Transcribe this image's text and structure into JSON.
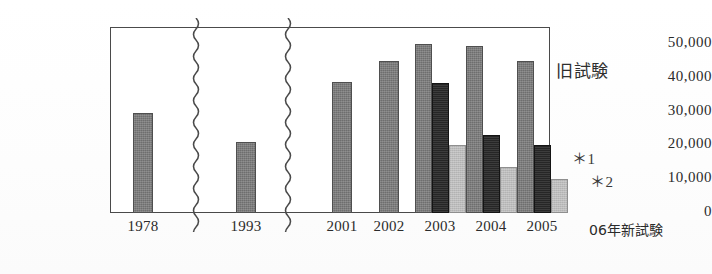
{
  "chart_data": {
    "type": "bar",
    "title": "",
    "xlabel": "",
    "ylabel": "",
    "ylim": [
      0,
      55000
    ],
    "grid": true,
    "legend_position": "inside-right",
    "categories": [
      "1978",
      "1993",
      "2001",
      "2002",
      "2003",
      "2004",
      "2005"
    ],
    "series": [
      {
        "name": "series-1",
        "color": "#6e6e6e",
        "values": [
          29500,
          21000,
          38700,
          45000,
          50000,
          49500,
          45000
        ]
      },
      {
        "name": "series-2",
        "color": "#262626",
        "values": [
          null,
          null,
          null,
          null,
          38500,
          23000,
          20000
        ]
      },
      {
        "name": "series-3",
        "color": "#bcbcbc",
        "values": [
          null,
          null,
          null,
          null,
          20000,
          13500,
          10000
        ]
      }
    ],
    "y_ticks": [
      "50,000",
      "40,000",
      "30,000",
      "20,000",
      "10,000",
      "0"
    ],
    "y_tick_values": [
      50000,
      40000,
      30000,
      20000,
      10000,
      0
    ],
    "annotations": [
      {
        "name": "legend-old-exam",
        "text": "旧試験"
      },
      {
        "name": "note-star-1",
        "text": "＊1"
      },
      {
        "name": "note-star-2",
        "text": "＊2"
      },
      {
        "name": "axis-outer-new-exam",
        "text": "06年新試験"
      }
    ],
    "axis_breaks": [
      {
        "after_category": "1978"
      },
      {
        "after_category": "1993"
      }
    ]
  },
  "colors": {
    "series_1": "#6e6e6e",
    "series_2": "#262626",
    "series_3": "#bcbcbc",
    "axis": "#4a4a4a",
    "gridline": "#8a8a8a",
    "text": "#2b2b2b",
    "background": "#ffffff"
  }
}
